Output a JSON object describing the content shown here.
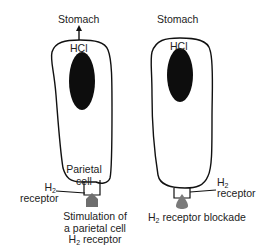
{
  "left_panel": {
    "title": "Stomach",
    "acid_label": "HCl",
    "cell_label_line1": "Parietal",
    "cell_label_line2": "cell",
    "receptor_label_h": "H",
    "receptor_label_sub": "2",
    "receptor_label_word": "receptor",
    "caption_line1": "Stimulation of",
    "caption_line2": "a parietal cell",
    "caption_line3_h": "H",
    "caption_line3_sub": "2",
    "caption_line3_rest": " receptor",
    "has_secretion_arrow": true
  },
  "right_panel": {
    "title": "Stomach",
    "acid_label": "HCl",
    "receptor_label_h": "H",
    "receptor_label_sub": "2",
    "receptor_label_word": "receptor",
    "caption_h": "H",
    "caption_sub": "2",
    "caption_rest": " receptor blockade",
    "has_secretion_arrow": false
  },
  "colors": {
    "outline": "#111111",
    "nucleus": "#0d0d0d",
    "agonist": "#6e6e6e",
    "antagonist": "#7a7a7a"
  }
}
